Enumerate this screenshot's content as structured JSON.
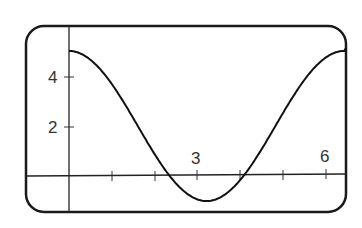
{
  "chart_data": {
    "type": "line",
    "title": "",
    "xlabel": "",
    "ylabel": "",
    "x_ticks": [
      1,
      2,
      3,
      4,
      5,
      6
    ],
    "x_tick_labels": [
      {
        "value": 3,
        "label": "3"
      },
      {
        "value": 6,
        "label": "6"
      }
    ],
    "y_ticks": [
      2,
      4
    ],
    "y_tick_labels": [
      {
        "value": 4,
        "label": "4"
      },
      {
        "value": 2,
        "label": "2"
      }
    ],
    "xlim": [
      -0.95,
      6.5
    ],
    "ylim": [
      -1.45,
      6.0
    ],
    "grid": false,
    "legend": null,
    "series": [
      {
        "name": "curve",
        "description": "periodic cosine-like curve, max 5 at x=0, min -1 near x=3.2, max 5 near x=6.4",
        "x": [
          0,
          0.5,
          1,
          1.5,
          2,
          2.5,
          3,
          3.2,
          3.5,
          4,
          4.5,
          5,
          5.5,
          6,
          6.4
        ],
        "y": [
          5.0,
          4.66,
          3.67,
          2.24,
          0.7,
          -0.56,
          -0.94,
          -1.0,
          -0.87,
          -0.2,
          1.03,
          2.56,
          3.96,
          4.88,
          5.0
        ]
      }
    ]
  },
  "labels": {
    "y4": "4",
    "y2": "2",
    "x3": "3",
    "x6": "6"
  }
}
